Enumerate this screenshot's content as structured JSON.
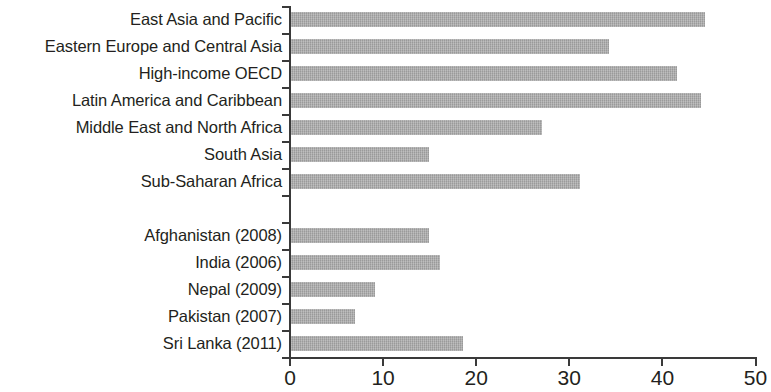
{
  "chart_data": {
    "type": "bar",
    "orientation": "horizontal",
    "title": "",
    "subtitle": "",
    "xlabel": "",
    "ylabel": "",
    "xlim": [
      0,
      50
    ],
    "xticks": [
      0,
      10,
      20,
      30,
      40,
      50
    ],
    "xticklabels": [
      "0",
      "10",
      "20",
      "30",
      "40",
      "50"
    ],
    "grid": false,
    "legend": null,
    "bar_color": "#a9a9a9",
    "axis_color": "#3a3a3a",
    "categories": [
      "East Asia and Pacific",
      "Eastern Europe and Central Asia",
      "High-income OECD",
      "Latin America and Caribbean",
      "Middle East and North Africa",
      "South Asia",
      "Sub-Saharan Africa",
      "",
      "Afghanistan (2008)",
      "India (2006)",
      "Nepal (2009)",
      "Pakistan (2007)",
      "Sri Lanka (2011)"
    ],
    "values": [
      44.5,
      34.2,
      41.5,
      44.0,
      27.0,
      14.8,
      31.0,
      null,
      14.8,
      16.0,
      9.0,
      6.9,
      18.5
    ],
    "groups": [
      {
        "name": "Regions",
        "categories": [
          "East Asia and Pacific",
          "Eastern Europe and Central Asia",
          "High-income OECD",
          "Latin America and Caribbean",
          "Middle East and North Africa",
          "South Asia",
          "Sub-Saharan Africa"
        ],
        "values": [
          44.5,
          34.2,
          41.5,
          44.0,
          27.0,
          14.8,
          31.0
        ]
      },
      {
        "name": "Countries",
        "categories": [
          "Afghanistan (2008)",
          "India (2006)",
          "Nepal (2009)",
          "Pakistan (2007)",
          "Sri Lanka (2011)"
        ],
        "values": [
          14.8,
          16.0,
          9.0,
          6.9,
          18.5
        ]
      }
    ]
  },
  "rows": [
    {
      "label": "East Asia and Pacific",
      "value": 44.5,
      "spacer": false
    },
    {
      "label": "Eastern Europe and Central Asia",
      "value": 34.2,
      "spacer": false
    },
    {
      "label": "High-income OECD",
      "value": 41.5,
      "spacer": false
    },
    {
      "label": "Latin America and Caribbean",
      "value": 44.0,
      "spacer": false
    },
    {
      "label": "Middle East and North Africa",
      "value": 27.0,
      "spacer": false
    },
    {
      "label": "South Asia",
      "value": 14.8,
      "spacer": false
    },
    {
      "label": "Sub-Saharan Africa",
      "value": 31.0,
      "spacer": false
    },
    {
      "label": "",
      "value": null,
      "spacer": true
    },
    {
      "label": "Afghanistan (2008)",
      "value": 14.8,
      "spacer": false
    },
    {
      "label": "India (2006)",
      "value": 16.0,
      "spacer": false
    },
    {
      "label": "Nepal (2009)",
      "value": 9.0,
      "spacer": false
    },
    {
      "label": "Pakistan (2007)",
      "value": 6.9,
      "spacer": false
    },
    {
      "label": "Sri Lanka (2011)",
      "value": 18.5,
      "spacer": false
    }
  ],
  "axis": {
    "ticks": [
      {
        "value": 0,
        "label": "0"
      },
      {
        "value": 10,
        "label": "10"
      },
      {
        "value": 20,
        "label": "20"
      },
      {
        "value": 30,
        "label": "30"
      },
      {
        "value": 40,
        "label": "40"
      },
      {
        "value": 50,
        "label": "50"
      }
    ]
  }
}
